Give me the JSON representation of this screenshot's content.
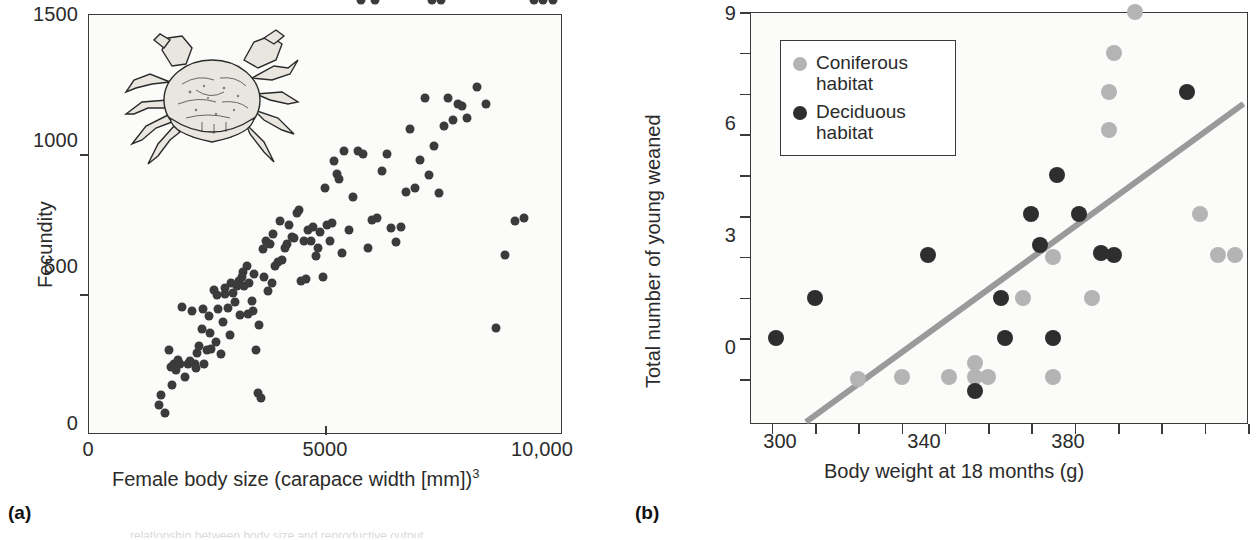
{
  "figure": {
    "panel_a_letter": "(a)",
    "panel_b_letter": "(b)",
    "caption_fragment": "relationship between body size and reproductive output"
  },
  "chart_data": [
    {
      "id": "panel-a",
      "type": "scatter",
      "title": "",
      "xlabel": "Female body size (carapace width [mm])",
      "xlabel_exponent": "3",
      "ylabel": "Fecundity",
      "xlim": [
        0,
        10000
      ],
      "ylim": [
        0,
        1500
      ],
      "grid": false,
      "legend": "none",
      "xticks": [
        0,
        5000,
        10000
      ],
      "xticklabels": [
        "0",
        "5000",
        "10,000"
      ],
      "yticks": [
        0,
        500,
        1000,
        1500
      ],
      "yticklabels": [
        "0",
        "500",
        "1000",
        "1500"
      ],
      "marker_color": "#3b3b3b",
      "series": [
        {
          "name": "Crab fecundity",
          "x": [
            1500,
            1550,
            1620,
            1700,
            1750,
            1780,
            1820,
            1850,
            1900,
            1950,
            1980,
            2050,
            2100,
            2150,
            2200,
            2250,
            2280,
            2300,
            2350,
            2400,
            2420,
            2450,
            2500,
            2550,
            2580,
            2600,
            2650,
            2700,
            2720,
            2750,
            2800,
            2850,
            2880,
            2900,
            2950,
            3000,
            3020,
            3050,
            3100,
            3150,
            3180,
            3200,
            3250,
            3280,
            3300,
            3350,
            3380,
            3400,
            3450,
            3480,
            3500,
            3550,
            3580,
            3600,
            3650,
            3700,
            3720,
            3750,
            3800,
            3850,
            3880,
            3900,
            3950,
            4000,
            4050,
            4100,
            4150,
            4200,
            4250,
            4300,
            4350,
            4400,
            4450,
            4500,
            4550,
            4600,
            4650,
            4700,
            4750,
            4800,
            4850,
            4900,
            4950,
            5000,
            5050,
            5100,
            5150,
            5200,
            5250,
            5300,
            5350,
            5400,
            5500,
            5600,
            5700,
            5800,
            5900,
            6000,
            6100,
            6200,
            6300,
            6400,
            6500,
            6600,
            6700,
            6800,
            6900,
            7000,
            7100,
            7200,
            7300,
            7400,
            7500,
            7600,
            7700,
            7800,
            7900,
            8000,
            8200,
            8400,
            8600,
            8800,
            9000,
            9200,
            9400,
            9600,
            9800,
            5750,
            6050,
            7250,
            7450
          ],
          "y": [
            105,
            140,
            75,
            300,
            240,
            175,
            250,
            230,
            265,
            250,
            455,
            205,
            250,
            260,
            440,
            250,
            235,
            290,
            315,
            375,
            445,
            250,
            300,
            420,
            360,
            305,
            515,
            330,
            495,
            445,
            285,
            400,
            520,
            500,
            450,
            355,
            540,
            505,
            470,
            530,
            545,
            425,
            560,
            580,
            530,
            600,
            430,
            540,
            475,
            440,
            570,
            300,
            145,
            390,
            130,
            660,
            560,
            690,
            510,
            680,
            540,
            715,
            600,
            615,
            760,
            620,
            665,
            680,
            745,
            705,
            700,
            790,
            800,
            545,
            690,
            555,
            730,
            690,
            740,
            635,
            665,
            720,
            560,
            880,
            745,
            690,
            755,
            975,
            930,
            910,
            645,
            1010,
            730,
            845,
            1010,
            1000,
            665,
            765,
            770,
            940,
            1000,
            735,
            685,
            740,
            865,
            1090,
            880,
            980,
            1200,
            925,
            1030,
            860,
            1100,
            1200,
            1120,
            1180,
            1170,
            1130,
            1240,
            1180,
            380,
            640,
            760,
            770
          ]
        }
      ]
    },
    {
      "id": "panel-b",
      "type": "scatter",
      "title": "",
      "xlabel": "Body weight at 18 months (g)",
      "ylabel": "Total number of young weaned",
      "xlim": [
        285,
        400
      ],
      "ylim": [
        -1.1,
        9
      ],
      "grid": false,
      "legend_position": "upper-left",
      "xticks": [
        300,
        340,
        380
      ],
      "xticklabels": [
        "300",
        "340",
        "380"
      ],
      "xminorticks": [
        290,
        310,
        320,
        330,
        350,
        360,
        370,
        390,
        400
      ],
      "yticks": [
        0,
        3,
        6,
        9
      ],
      "yticklabels": [
        "0",
        "3",
        "6",
        "9"
      ],
      "yminorticks": [
        1,
        2,
        4,
        5,
        7,
        8
      ],
      "legend_entries": [
        {
          "label_line1": "Coniferous",
          "label_line2": "habitat",
          "color": "#b4b4b4",
          "key": "coniferous"
        },
        {
          "label_line1": "Deciduous",
          "label_line2": "habitat",
          "color": "#2e2e2e",
          "key": "deciduous"
        }
      ],
      "series": [
        {
          "name": "Coniferous habitat",
          "color": "#b4b4b4",
          "x": [
            310,
            320,
            331,
            337,
            337,
            340,
            348,
            355,
            355,
            364,
            368,
            368,
            369,
            374,
            389,
            393,
            397
          ],
          "y": [
            0,
            0.05,
            0.05,
            0.05,
            0.4,
            0.05,
            2,
            0.05,
            3,
            2,
            6.1,
            7.05,
            8,
            9,
            4.05,
            3.05,
            3.05
          ]
        },
        {
          "name": "Deciduous habitat",
          "color": "#2e2e2e",
          "x": [
            291,
            300,
            326,
            337,
            343,
            344,
            350,
            352,
            355,
            356,
            361,
            366,
            369,
            386
          ],
          "y": [
            1,
            2,
            3.05,
            -0.3,
            2,
            1,
            4.05,
            3.3,
            1,
            5,
            4.05,
            3.1,
            3.05,
            7.05
          ]
        }
      ],
      "trendline": {
        "label": "regression line",
        "color": "#9a9a9a",
        "x_start": 298,
        "y_start": -1.05,
        "x_end": 399,
        "y_end": 6.75
      }
    }
  ]
}
